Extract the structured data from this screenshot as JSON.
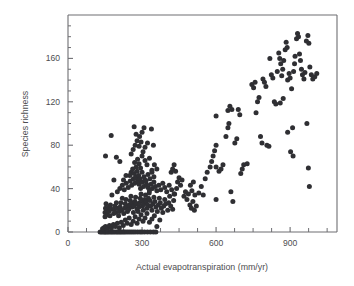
{
  "figure": {
    "background_color": "#ffffff",
    "frame_color": "#6e6e72",
    "point_color": "#2f2f33",
    "point_radius": 2.5
  },
  "chart_data": {
    "type": "scatter",
    "title": "",
    "xlabel": "Actual evapotranspiration (mm/yr)",
    "ylabel": "Species richness",
    "xlim": [
      0,
      1090
    ],
    "ylim": [
      0,
      200
    ],
    "grid": false,
    "legend": "none",
    "x_major_ticks": [
      0,
      300,
      600,
      900
    ],
    "x_major_tick_labels": [
      "0",
      "300",
      "600",
      "900"
    ],
    "x_minor_ticks": [
      75,
      150,
      225,
      375,
      450,
      525,
      675,
      750,
      825,
      975,
      1050
    ],
    "y_major_ticks": [
      0,
      40,
      80,
      120,
      160
    ],
    "y_major_tick_labels": [
      "0",
      "40",
      "80",
      "120",
      "160"
    ],
    "y_minor_ticks": [
      10,
      20,
      30,
      50,
      60,
      70,
      90,
      100,
      110,
      130,
      140,
      150,
      170,
      180,
      190
    ],
    "n_points": 267,
    "points": [
      [
        130,
        0
      ],
      [
        136,
        0
      ],
      [
        142,
        0
      ],
      [
        148,
        0
      ],
      [
        152,
        0
      ],
      [
        158,
        0
      ],
      [
        163,
        0
      ],
      [
        170,
        0
      ],
      [
        176,
        0
      ],
      [
        182,
        0
      ],
      [
        188,
        0
      ],
      [
        195,
        0
      ],
      [
        201,
        0
      ],
      [
        207,
        0
      ],
      [
        213,
        0
      ],
      [
        219,
        0
      ],
      [
        226,
        0
      ],
      [
        232,
        0
      ],
      [
        240,
        0
      ],
      [
        248,
        0
      ],
      [
        256,
        0
      ],
      [
        264,
        0
      ],
      [
        272,
        0
      ],
      [
        282,
        0
      ],
      [
        292,
        0
      ],
      [
        300,
        0
      ],
      [
        310,
        0
      ],
      [
        322,
        0
      ],
      [
        334,
        0
      ],
      [
        346,
        0
      ],
      [
        356,
        0
      ],
      [
        140,
        3
      ],
      [
        146,
        4
      ],
      [
        152,
        5
      ],
      [
        160,
        3
      ],
      [
        168,
        6
      ],
      [
        176,
        4
      ],
      [
        184,
        7
      ],
      [
        192,
        5
      ],
      [
        200,
        8
      ],
      [
        208,
        4
      ],
      [
        216,
        9
      ],
      [
        224,
        6
      ],
      [
        232,
        11
      ],
      [
        240,
        8
      ],
      [
        248,
        13
      ],
      [
        256,
        7
      ],
      [
        264,
        10
      ],
      [
        272,
        14
      ],
      [
        280,
        8
      ],
      [
        288,
        12
      ],
      [
        296,
        16
      ],
      [
        304,
        10
      ],
      [
        312,
        13
      ],
      [
        320,
        17
      ],
      [
        330,
        9
      ],
      [
        340,
        12
      ],
      [
        350,
        15
      ],
      [
        360,
        5
      ],
      [
        372,
        11
      ],
      [
        150,
        14
      ],
      [
        150,
        18
      ],
      [
        152,
        22
      ],
      [
        154,
        26
      ],
      [
        156,
        20
      ],
      [
        158,
        16
      ],
      [
        165,
        19
      ],
      [
        167,
        23
      ],
      [
        170,
        15
      ],
      [
        172,
        25
      ],
      [
        175,
        21
      ],
      [
        185,
        17
      ],
      [
        187,
        21
      ],
      [
        190,
        24
      ],
      [
        193,
        18
      ],
      [
        196,
        27
      ],
      [
        199,
        22
      ],
      [
        205,
        15
      ],
      [
        208,
        19
      ],
      [
        211,
        23
      ],
      [
        214,
        27
      ],
      [
        217,
        20
      ],
      [
        220,
        31
      ],
      [
        226,
        17
      ],
      [
        229,
        22
      ],
      [
        232,
        26
      ],
      [
        235,
        30
      ],
      [
        238,
        24
      ],
      [
        241,
        19
      ],
      [
        246,
        21
      ],
      [
        249,
        25
      ],
      [
        252,
        29
      ],
      [
        255,
        33
      ],
      [
        258,
        27
      ],
      [
        261,
        23
      ],
      [
        265,
        18
      ],
      [
        268,
        24
      ],
      [
        271,
        28
      ],
      [
        274,
        32
      ],
      [
        277,
        26
      ],
      [
        280,
        21
      ],
      [
        284,
        19
      ],
      [
        287,
        23
      ],
      [
        290,
        27
      ],
      [
        293,
        31
      ],
      [
        296,
        35
      ],
      [
        299,
        29
      ],
      [
        302,
        24
      ],
      [
        305,
        20
      ],
      [
        308,
        26
      ],
      [
        311,
        30
      ],
      [
        314,
        34
      ],
      [
        317,
        28
      ],
      [
        320,
        22
      ],
      [
        323,
        25
      ],
      [
        326,
        31
      ],
      [
        329,
        36
      ],
      [
        332,
        29
      ],
      [
        335,
        24
      ],
      [
        340,
        20
      ],
      [
        344,
        26
      ],
      [
        348,
        32
      ],
      [
        352,
        28
      ],
      [
        356,
        23
      ],
      [
        362,
        19
      ],
      [
        366,
        25
      ],
      [
        370,
        31
      ],
      [
        374,
        27
      ],
      [
        378,
        22
      ],
      [
        384,
        18
      ],
      [
        388,
        24
      ],
      [
        392,
        30
      ],
      [
        396,
        26
      ],
      [
        404,
        20
      ],
      [
        408,
        27
      ],
      [
        412,
        33
      ],
      [
        416,
        24
      ],
      [
        424,
        21
      ],
      [
        428,
        29
      ],
      [
        432,
        35
      ],
      [
        200,
        37
      ],
      [
        210,
        40
      ],
      [
        220,
        43
      ],
      [
        228,
        39
      ],
      [
        236,
        45
      ],
      [
        244,
        41
      ],
      [
        252,
        47
      ],
      [
        258,
        43
      ],
      [
        265,
        49
      ],
      [
        270,
        45
      ],
      [
        276,
        51
      ],
      [
        282,
        47
      ],
      [
        288,
        44
      ],
      [
        294,
        40
      ],
      [
        300,
        46
      ],
      [
        306,
        42
      ],
      [
        312,
        48
      ],
      [
        318,
        44
      ],
      [
        324,
        41
      ],
      [
        330,
        38
      ],
      [
        336,
        44
      ],
      [
        342,
        40
      ],
      [
        348,
        46
      ],
      [
        354,
        42
      ],
      [
        360,
        38
      ],
      [
        368,
        43
      ],
      [
        376,
        39
      ],
      [
        384,
        45
      ],
      [
        392,
        41
      ],
      [
        400,
        37
      ],
      [
        410,
        43
      ],
      [
        420,
        39
      ],
      [
        430,
        35
      ],
      [
        440,
        40
      ],
      [
        250,
        52
      ],
      [
        256,
        55
      ],
      [
        262,
        58
      ],
      [
        268,
        54
      ],
      [
        274,
        50
      ],
      [
        280,
        56
      ],
      [
        286,
        52
      ],
      [
        292,
        49
      ],
      [
        300,
        55
      ],
      [
        308,
        51
      ],
      [
        316,
        47
      ],
      [
        324,
        53
      ],
      [
        332,
        49
      ],
      [
        340,
        55
      ],
      [
        348,
        51
      ],
      [
        225,
        48
      ],
      [
        235,
        52
      ],
      [
        178,
        34
      ],
      [
        186,
        48
      ],
      [
        270,
        64
      ],
      [
        276,
        60
      ],
      [
        282,
        67
      ],
      [
        288,
        63
      ],
      [
        294,
        59
      ],
      [
        300,
        70
      ],
      [
        312,
        66
      ],
      [
        320,
        62
      ],
      [
        330,
        68
      ],
      [
        340,
        57
      ],
      [
        350,
        62
      ],
      [
        360,
        58
      ],
      [
        256,
        72
      ],
      [
        264,
        76
      ],
      [
        272,
        80
      ],
      [
        280,
        84
      ],
      [
        288,
        79
      ],
      [
        296,
        83
      ],
      [
        304,
        74
      ],
      [
        312,
        78
      ],
      [
        322,
        82
      ],
      [
        290,
        88
      ],
      [
        300,
        92
      ],
      [
        308,
        96
      ],
      [
        268,
        97
      ],
      [
        276,
        90
      ],
      [
        338,
        95
      ],
      [
        346,
        80
      ],
      [
        152,
        70
      ],
      [
        175,
        89
      ],
      [
        196,
        69
      ],
      [
        210,
        65
      ],
      [
        418,
        55
      ],
      [
        424,
        58
      ],
      [
        430,
        62
      ],
      [
        436,
        56
      ],
      [
        444,
        46
      ],
      [
        450,
        50
      ],
      [
        456,
        43
      ],
      [
        462,
        48
      ],
      [
        470,
        33
      ],
      [
        476,
        37
      ],
      [
        482,
        30
      ],
      [
        488,
        35
      ],
      [
        494,
        25
      ],
      [
        500,
        22
      ],
      [
        506,
        28
      ],
      [
        512,
        20
      ],
      [
        520,
        24
      ],
      [
        496,
        43
      ],
      [
        502,
        38
      ],
      [
        508,
        46
      ],
      [
        514,
        34
      ],
      [
        530,
        36
      ],
      [
        540,
        42
      ],
      [
        548,
        34
      ],
      [
        556,
        49
      ],
      [
        564,
        55
      ],
      [
        576,
        60
      ],
      [
        582,
        65
      ],
      [
        588,
        70
      ],
      [
        594,
        75
      ],
      [
        600,
        80
      ],
      [
        600,
        60
      ],
      [
        600,
        30
      ],
      [
        600,
        107
      ],
      [
        612,
        56
      ],
      [
        620,
        58
      ],
      [
        628,
        62
      ],
      [
        640,
        88
      ],
      [
        648,
        112
      ],
      [
        656,
        116
      ],
      [
        664,
        113
      ],
      [
        648,
        96
      ],
      [
        652,
        100
      ],
      [
        660,
        37
      ],
      [
        668,
        28
      ],
      [
        676,
        82
      ],
      [
        684,
        86
      ],
      [
        690,
        113
      ],
      [
        696,
        108
      ],
      [
        700,
        54
      ],
      [
        706,
        58
      ],
      [
        712,
        62
      ],
      [
        726,
        63
      ],
      [
        745,
        136
      ],
      [
        752,
        133
      ],
      [
        758,
        138
      ],
      [
        762,
        110
      ],
      [
        768,
        120
      ],
      [
        774,
        124
      ],
      [
        780,
        88
      ],
      [
        786,
        82
      ],
      [
        790,
        141
      ],
      [
        796,
        138
      ],
      [
        802,
        134
      ],
      [
        806,
        80
      ],
      [
        814,
        79
      ],
      [
        818,
        160
      ],
      [
        824,
        145
      ],
      [
        830,
        142
      ],
      [
        836,
        120
      ],
      [
        842,
        118
      ],
      [
        848,
        148
      ],
      [
        854,
        165
      ],
      [
        858,
        160
      ],
      [
        862,
        155
      ],
      [
        866,
        144
      ],
      [
        870,
        150
      ],
      [
        874,
        158
      ],
      [
        880,
        168
      ],
      [
        884,
        175
      ],
      [
        888,
        170
      ],
      [
        890,
        140
      ],
      [
        896,
        146
      ],
      [
        900,
        142
      ],
      [
        906,
        132
      ],
      [
        910,
        96
      ],
      [
        914,
        148
      ],
      [
        918,
        155
      ],
      [
        920,
        162
      ],
      [
        926,
        178
      ],
      [
        930,
        183
      ],
      [
        934,
        180
      ],
      [
        938,
        164
      ],
      [
        942,
        158
      ],
      [
        946,
        150
      ],
      [
        950,
        145
      ],
      [
        956,
        141
      ],
      [
        960,
        147
      ],
      [
        890,
        92
      ],
      [
        902,
        74
      ],
      [
        912,
        70
      ],
      [
        966,
        176
      ],
      [
        972,
        181
      ],
      [
        976,
        174
      ],
      [
        980,
        152
      ],
      [
        986,
        145
      ],
      [
        992,
        141
      ],
      [
        1000,
        143
      ],
      [
        1008,
        146
      ],
      [
        968,
        100
      ],
      [
        974,
        59
      ],
      [
        978,
        42
      ],
      [
        860,
        119
      ],
      [
        872,
        123
      ]
    ]
  }
}
